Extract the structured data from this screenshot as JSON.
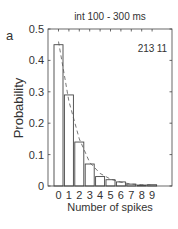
{
  "panel_label": "a",
  "chart_data": {
    "type": "bar",
    "title": "int 100 - 300 ms",
    "xlabel": "Number of spikes",
    "ylabel": "Probability",
    "categories": [
      "0",
      "1",
      "2",
      "3",
      "4",
      "5",
      "6",
      "7",
      "8",
      "9"
    ],
    "series": [
      {
        "name": "observed",
        "style": "bar",
        "values": [
          0.45,
          0.29,
          0.14,
          0.07,
          0.03,
          0.02,
          0.013,
          0.006,
          0.003,
          0.004
        ]
      },
      {
        "name": "fit",
        "style": "dashed-line",
        "values": [
          0.46,
          0.27,
          0.15,
          0.075,
          0.04,
          0.022,
          0.012,
          0.006,
          0.004,
          0.003
        ]
      }
    ],
    "annotations": [
      "213",
      "11"
    ],
    "yticks": [
      "0",
      "0.1",
      "0.2",
      "0.3",
      "0.4",
      "0.5"
    ],
    "ylim": [
      0,
      0.5
    ],
    "grid": false,
    "legend": null
  }
}
